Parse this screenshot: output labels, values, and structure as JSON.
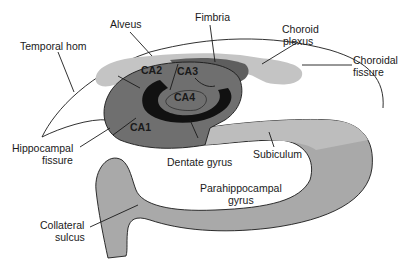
{
  "diagram": {
    "type": "anatomical cross-section",
    "colors": {
      "cornu_ammonis": "#6f6f6f",
      "dentate_gyrus": "#111111",
      "ca4": "#6f6f6f",
      "alveus_choroid": "#c4c4c4",
      "fimbria": "#5e5e5e",
      "subiculum": "#bdbdbd",
      "parahippocampal": "#a9a9a9",
      "outline": "#1a1a1a",
      "background": "#ffffff"
    },
    "labels": {
      "alveus": "Alveus",
      "fimbria": "Fimbria",
      "choroid_plexus_line1": "Choroid",
      "choroid_plexus_line2": "plexus",
      "choroidal_fissure_line1": "Choroidal",
      "choroidal_fissure_line2": "fissure",
      "temporal_horn": "Temporal hom",
      "ca1": "CA1",
      "ca2": "CA2",
      "ca3": "CA3",
      "ca4": "CA4",
      "hippocampal_fissure_line1": "Hippocampal",
      "hippocampal_fissure_line2": "fissure",
      "dentate_gyrus": "Dentate gyrus",
      "subiculum": "Subiculum",
      "parahippocampal_line1": "Parahippocampal",
      "parahippocampal_line2": "gyrus",
      "collateral_sulcus_line1": "Collateral",
      "collateral_sulcus_line2": "sulcus"
    }
  }
}
